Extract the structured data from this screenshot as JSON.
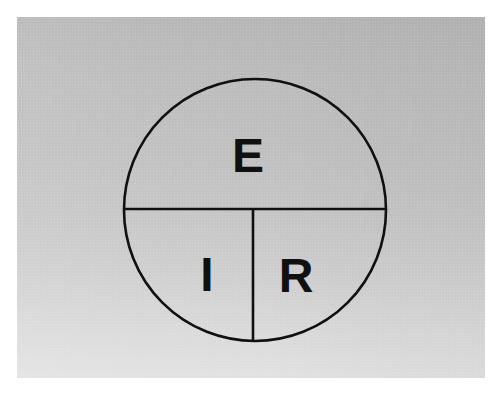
{
  "document": {
    "title": "Ohm's Law Circle Diagram",
    "medium": "photographed paper card",
    "paper": {
      "background_top_color": "#b6b6b6",
      "background_bottom_color": "#e2e2e2",
      "surround_color": "#ffffff",
      "left": 17,
      "top": 17,
      "width": 468,
      "height": 361
    }
  },
  "diagram": {
    "type": "ohms-law-circle",
    "stroke_color": "#101010",
    "stroke_width": 2.6,
    "fill": "none",
    "circle": {
      "center_x": 255,
      "center_y": 210,
      "radius": 131
    },
    "dividers": [
      {
        "name": "horizontal-diameter",
        "orientation": "horizontal",
        "x1": 124,
        "y1": 209,
        "x2": 386,
        "y2": 209
      },
      {
        "name": "vertical-radius",
        "orientation": "vertical",
        "x1": 253,
        "y1": 209,
        "x2": 253,
        "y2": 341
      }
    ],
    "sectors": [
      {
        "id": "top",
        "name": "voltage-sector",
        "label": "E",
        "meaning": "Voltage",
        "label_x": 248,
        "label_y": 172,
        "font_size": 48
      },
      {
        "id": "bottom-left",
        "name": "current-sector",
        "label": "I",
        "meaning": "Current",
        "label_x": 207,
        "label_y": 291,
        "font_size": 48
      },
      {
        "id": "bottom-right",
        "name": "resistance-sector",
        "label": "R",
        "meaning": "Resistance",
        "label_x": 296,
        "label_y": 292,
        "font_size": 48
      }
    ]
  },
  "chart_data": {
    "type": "pie",
    "categories": [
      "E",
      "I",
      "R"
    ],
    "values": [
      50,
      25,
      25
    ],
    "labels": [
      "E",
      "I",
      "R"
    ],
    "legend": [],
    "xlabel": "",
    "ylabel": "",
    "grid": false,
    "annotations": [
      {
        "text": "E",
        "position": "top-half"
      },
      {
        "text": "I",
        "position": "bottom-left-quadrant"
      },
      {
        "text": "R",
        "position": "bottom-right-quadrant"
      }
    ]
  }
}
